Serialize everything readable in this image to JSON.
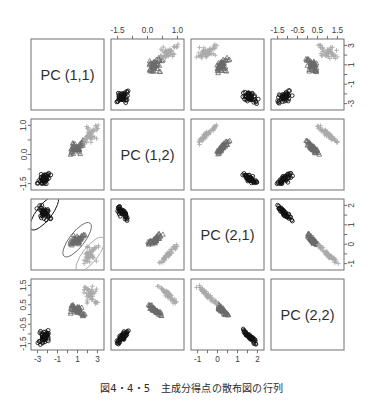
{
  "figure": {
    "caption": "図4・4・5　主成分得点の散布図の行列",
    "type": "scatter-plot-matrix",
    "panel_labels": [
      "PC (1,1)",
      "PC (1,2)",
      "PC (2,1)",
      "PC (2,2)"
    ]
  },
  "chart_data": {
    "type": "scatter",
    "title": "主成分得点の散布図の行列",
    "variables": [
      "PC (1,1)",
      "PC (1,2)",
      "PC (2,1)",
      "PC (2,2)"
    ],
    "grid": false,
    "legend": "none",
    "groups": [
      {
        "name": "group-1",
        "symbol": "circle",
        "color": "#111111",
        "n": 50
      },
      {
        "name": "group-2",
        "symbol": "triangle",
        "color": "#6b6b6b",
        "n": 50
      },
      {
        "name": "group-3",
        "symbol": "plus",
        "color": "#aaaaaa",
        "n": 50
      }
    ],
    "axes": {
      "top": [
        {
          "column": 1,
          "shown": false,
          "ticks": []
        },
        {
          "column": 2,
          "shown": true,
          "ticks": [
            "-1.5",
            "0.0",
            "1.0"
          ],
          "values": [
            -1.5,
            0.0,
            1.0
          ]
        },
        {
          "column": 3,
          "shown": false,
          "ticks": []
        },
        {
          "column": 4,
          "shown": true,
          "ticks": [
            "-1.5",
            "-0.5",
            "0.5",
            "1.5"
          ],
          "values": [
            -1.5,
            -0.5,
            0.5,
            1.5
          ]
        }
      ],
      "bottom": [
        {
          "column": 1,
          "shown": true,
          "ticks": [
            "-3",
            "-1",
            "1",
            "3"
          ],
          "values": [
            -3,
            -1,
            1,
            3
          ]
        },
        {
          "column": 2,
          "shown": false,
          "ticks": []
        },
        {
          "column": 3,
          "shown": true,
          "ticks": [
            "-1",
            "0",
            "1",
            "2"
          ],
          "values": [
            -1,
            0,
            1,
            2
          ]
        },
        {
          "column": 4,
          "shown": false,
          "ticks": []
        }
      ],
      "left": [
        {
          "row": 1,
          "shown": false,
          "ticks": []
        },
        {
          "row": 2,
          "shown": true,
          "ticks": [
            "1.0",
            "0.0",
            "-1.5"
          ],
          "values": [
            1.0,
            0.0,
            -1.5
          ]
        },
        {
          "row": 3,
          "shown": false,
          "ticks": []
        },
        {
          "row": 4,
          "shown": true,
          "ticks": [
            "1.5",
            "0.5",
            "-0.5",
            "-1.5"
          ],
          "values": [
            1.5,
            0.5,
            -0.5,
            -1.5
          ]
        }
      ],
      "right": [
        {
          "row": 1,
          "shown": true,
          "ticks": [
            "3",
            "1",
            "-1",
            "-3"
          ],
          "values": [
            3,
            1,
            -1,
            -3
          ]
        },
        {
          "row": 2,
          "shown": false,
          "ticks": []
        },
        {
          "row": 3,
          "shown": true,
          "ticks": [
            "2",
            "1",
            "0",
            "-1"
          ],
          "values": [
            2,
            1,
            0,
            -1
          ]
        },
        {
          "row": 4,
          "shown": false,
          "ticks": []
        }
      ]
    },
    "annotations": [
      {
        "panel": "row3-col1",
        "type": "ellipse",
        "count": 3,
        "note": "confidence ellipses around each group"
      }
    ],
    "series": {
      "PC (1,1)": {
        "group-1": [
          -2.62,
          -2.18,
          -2.51,
          -2.56,
          -2.72,
          -2.27,
          -2.55,
          -2.47,
          -2.82,
          -2.21,
          -2.36,
          -2.4,
          -2.3,
          -3.1,
          -2.9,
          -2.73,
          -2.64,
          -2.56,
          -2.19,
          -2.55,
          -2.11,
          -2.47,
          -3.0,
          -1.9,
          -2.2,
          -2.1,
          -2.35,
          -2.55,
          -2.57,
          -2.35,
          -2.27,
          -2.16,
          -2.52,
          -2.66,
          -2.2,
          -2.4,
          -2.47,
          -2.62,
          -2.85,
          -2.5,
          -2.65,
          -1.9,
          -2.8,
          -2.2,
          -2.1,
          -2.2,
          -2.5,
          -2.6,
          -2.6,
          -2.45
        ],
        "group-2": [
          1.1,
          0.73,
          1.25,
          0.4,
          1.0,
          1.6,
          0.5,
          1.4,
          1.0,
          1.0,
          0.75,
          1.1,
          0.8,
          1.25,
          0.5,
          0.9,
          1.0,
          0.4,
          1.6,
          0.4,
          1.3,
          0.6,
          1.5,
          1.0,
          1.1,
          1.25,
          1.5,
          1.6,
          1.0,
          0.4,
          0.5,
          0.7,
          0.9,
          1.5,
          1.0,
          1.1,
          0.9,
          0.6,
          0.5,
          1.0,
          1.1,
          1.3,
          0.3,
          1.2,
          0.9,
          0.9,
          0.8,
          1.0,
          0.4,
          0.8
        ],
        "group-3": [
          2.5,
          2.2,
          2.8,
          2.0,
          2.3,
          2.9,
          1.9,
          2.6,
          2.4,
          2.3,
          2.1,
          2.7,
          2.0,
          2.5,
          1.9,
          2.3,
          2.4,
          2.1,
          3.0,
          1.8,
          2.6,
          2.0,
          2.8,
          2.3,
          2.4,
          2.6,
          2.9,
          3.0,
          2.3,
          1.8,
          2.0,
          2.1,
          2.2,
          2.9,
          2.3,
          2.4,
          2.2,
          2.0,
          1.9,
          2.3,
          2.5,
          2.6,
          1.7,
          2.5,
          2.2,
          2.2,
          2.1,
          2.3,
          1.8,
          2.1
        ]
      },
      "PC (1,2)": {
        "group-1": [
          -1.3,
          -1.5,
          -1.4,
          -1.45,
          -1.3,
          -1.1,
          -1.35,
          -1.25,
          -1.5,
          -1.4,
          -1.2,
          -1.3,
          -1.45,
          -1.5,
          -1.2,
          -1.1,
          -1.2,
          -1.3,
          -1.15,
          -1.3,
          -1.2,
          -1.3,
          -1.5,
          -1.1,
          -1.2,
          -1.25,
          -1.35,
          -1.4,
          -1.3,
          -1.35,
          -1.4,
          -1.2,
          -1.3,
          -1.2,
          -1.4,
          -1.3,
          -1.35,
          -1.4,
          -1.45,
          -1.3,
          -1.35,
          -1.1,
          -1.5,
          -1.2,
          -1.15,
          -1.25,
          -1.3,
          -1.35,
          -1.4,
          -1.3
        ],
        "group-2": [
          0.1,
          0.2,
          -0.1,
          0.3,
          0.0,
          0.4,
          0.15,
          0.25,
          -0.05,
          0.1,
          0.2,
          0.05,
          0.3,
          0.1,
          -0.1,
          0.2,
          0.0,
          0.35,
          0.4,
          0.1,
          0.25,
          0.15,
          0.3,
          0.05,
          0.2,
          0.1,
          0.35,
          0.45,
          0.15,
          0.0,
          0.1,
          0.2,
          0.05,
          0.4,
          0.15,
          0.2,
          0.1,
          0.0,
          -0.05,
          0.15,
          0.25,
          0.3,
          -0.1,
          0.2,
          0.1,
          0.15,
          0.05,
          0.2,
          0.0,
          0.1
        ],
        "group-3": [
          0.7,
          0.9,
          0.5,
          1.0,
          0.6,
          1.1,
          0.75,
          0.95,
          0.45,
          0.7,
          0.85,
          0.6,
          1.0,
          0.7,
          0.4,
          0.8,
          0.6,
          1.05,
          1.1,
          0.6,
          0.9,
          0.7,
          1.0,
          0.6,
          0.8,
          0.7,
          1.05,
          1.15,
          0.75,
          0.5,
          0.6,
          0.8,
          0.65,
          1.1,
          0.75,
          0.85,
          0.7,
          0.55,
          0.45,
          0.75,
          0.9,
          0.95,
          0.35,
          0.85,
          0.7,
          0.75,
          0.6,
          0.8,
          0.5,
          0.7
        ]
      },
      "PC (2,1)": {
        "group-1": [
          1.2,
          1.4,
          1.1,
          1.5,
          1.3,
          0.9,
          1.25,
          1.35,
          1.6,
          1.2,
          1.0,
          1.3,
          1.45,
          1.5,
          1.1,
          0.95,
          1.15,
          1.25,
          1.05,
          1.3,
          1.1,
          1.2,
          1.55,
          1.0,
          1.1,
          1.2,
          1.3,
          1.4,
          1.25,
          1.3,
          1.35,
          1.15,
          1.25,
          1.1,
          1.35,
          1.25,
          1.3,
          1.35,
          1.4,
          1.25,
          1.3,
          0.9,
          1.5,
          1.1,
          1.05,
          1.2,
          1.25,
          1.3,
          1.35,
          1.25
        ],
        "group-2": [
          -0.2,
          -0.1,
          -0.3,
          0.0,
          -0.25,
          0.1,
          -0.15,
          -0.05,
          -0.35,
          -0.2,
          -0.1,
          -0.25,
          0.05,
          -0.2,
          -0.35,
          -0.1,
          -0.25,
          0.05,
          0.1,
          -0.2,
          -0.05,
          -0.15,
          0.0,
          -0.25,
          -0.1,
          -0.2,
          0.05,
          0.15,
          -0.15,
          -0.3,
          -0.25,
          -0.1,
          -0.2,
          0.1,
          -0.15,
          -0.1,
          -0.2,
          -0.3,
          -0.35,
          -0.15,
          -0.05,
          0.0,
          -0.4,
          -0.1,
          -0.2,
          -0.15,
          -0.25,
          -0.1,
          -0.3,
          -0.2
        ],
        "group-3": [
          -1.0,
          -0.8,
          -1.2,
          -0.6,
          -1.1,
          -0.5,
          -0.9,
          -0.7,
          -1.3,
          -1.0,
          -0.85,
          -1.1,
          -0.55,
          -1.0,
          -1.3,
          -0.8,
          -1.05,
          -0.55,
          -0.5,
          -1.0,
          -0.7,
          -0.9,
          -0.6,
          -1.05,
          -0.85,
          -1.0,
          -0.55,
          -0.45,
          -0.9,
          -1.2,
          -1.1,
          -0.8,
          -1.0,
          -0.5,
          -0.9,
          -0.85,
          -1.0,
          -1.15,
          -1.25,
          -0.9,
          -0.7,
          -0.65,
          -1.35,
          -0.85,
          -1.0,
          -0.9,
          -1.1,
          -0.8,
          -1.2,
          -1.0
        ]
      },
      "PC (2,2)": {
        "group-1": [
          -1.2,
          -1.4,
          -1.1,
          -1.5,
          -1.3,
          -0.9,
          -1.25,
          -1.35,
          -1.55,
          -1.2,
          -1.0,
          -1.3,
          -1.45,
          -1.5,
          -1.1,
          -0.95,
          -1.15,
          -1.25,
          -1.05,
          -1.3,
          -1.1,
          -1.2,
          -1.5,
          -1.0,
          -1.1,
          -1.2,
          -1.3,
          -1.4,
          -1.25,
          -1.3,
          -1.35,
          -1.15,
          -1.25,
          -1.1,
          -1.35,
          -1.25,
          -1.3,
          -1.35,
          -1.4,
          -1.25,
          -1.3,
          -0.9,
          -1.5,
          -1.1,
          -1.05,
          -1.2,
          -1.25,
          -1.3,
          -1.35,
          -1.25
        ],
        "group-2": [
          0.2,
          0.1,
          0.3,
          0.0,
          0.25,
          -0.1,
          0.15,
          0.05,
          0.35,
          0.2,
          0.1,
          0.25,
          -0.05,
          0.2,
          0.35,
          0.1,
          0.25,
          -0.05,
          -0.1,
          0.2,
          0.05,
          0.15,
          0.0,
          0.25,
          0.1,
          0.2,
          -0.05,
          -0.15,
          0.15,
          0.3,
          0.25,
          0.1,
          0.2,
          -0.1,
          0.15,
          0.1,
          0.2,
          0.3,
          0.35,
          0.15,
          0.05,
          0.0,
          0.4,
          0.1,
          0.2,
          0.15,
          0.25,
          0.1,
          0.3,
          0.2
        ],
        "group-3": [
          1.0,
          0.8,
          1.2,
          0.6,
          1.1,
          0.5,
          0.9,
          0.7,
          1.3,
          1.0,
          0.85,
          1.1,
          0.55,
          1.0,
          1.3,
          0.8,
          1.05,
          0.55,
          0.5,
          1.0,
          0.7,
          0.9,
          0.6,
          1.05,
          0.85,
          1.0,
          0.55,
          0.45,
          0.9,
          1.2,
          1.1,
          0.8,
          1.0,
          0.5,
          0.9,
          0.85,
          1.0,
          1.15,
          1.25,
          0.9,
          0.7,
          0.65,
          1.35,
          0.85,
          1.0,
          0.9,
          1.1,
          0.8,
          1.2,
          1.0
        ]
      }
    }
  }
}
